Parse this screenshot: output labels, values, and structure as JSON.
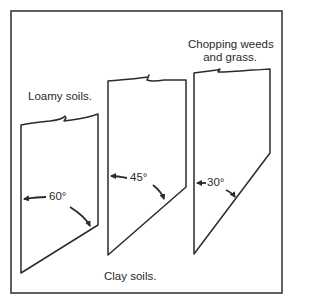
{
  "diagram": {
    "labels": {
      "loamy": "Loamy soils.",
      "clay": "Clay soils.",
      "weeds_line1": "Chopping weeds",
      "weeds_line2": "and grass."
    },
    "blades": [
      {
        "name": "blade-loamy",
        "angle_label": "60°",
        "angle": 60
      },
      {
        "name": "blade-clay",
        "angle_label": "45°",
        "angle": 45
      },
      {
        "name": "blade-weeds",
        "angle_label": "30°",
        "angle": 30
      }
    ],
    "colors": {
      "line": "#2b2b2b",
      "background": "#ffffff",
      "text": "#2a2a2a"
    }
  }
}
